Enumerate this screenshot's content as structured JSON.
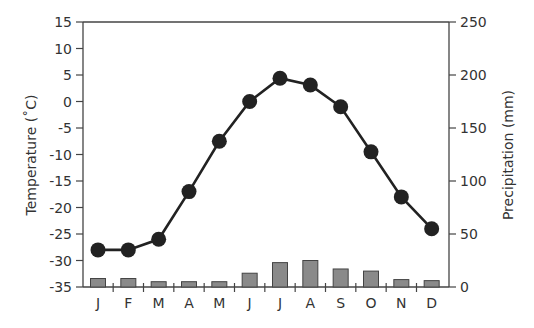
{
  "chart_data": {
    "type": "climate-chart (line + bar, dual axis)",
    "categories": [
      "J",
      "F",
      "M",
      "A",
      "M",
      "J",
      "J",
      "A",
      "S",
      "O",
      "N",
      "D"
    ],
    "series": [
      {
        "name": "Temperature",
        "type": "line",
        "axis": "left",
        "unit": "°C",
        "values": [
          -28,
          -28,
          -26,
          -17,
          -7.5,
          0,
          4.4,
          3.1,
          -1,
          -9.5,
          -18,
          -24
        ],
        "color": "#222222",
        "marker": "filled-circle"
      },
      {
        "name": "Precipitation",
        "type": "bar",
        "axis": "right",
        "unit": "mm",
        "values": [
          8,
          8,
          5,
          5,
          5,
          13,
          23,
          25,
          17,
          15,
          7,
          6
        ],
        "color": "#8a8a8a",
        "edge_color": "#444444"
      }
    ],
    "title": "",
    "xlabel": "",
    "ylabel": "Temperature (°C)",
    "y2label": "Precipitation (mm)",
    "ylim": [
      -35,
      15
    ],
    "y2lim": [
      0,
      250
    ],
    "yticks": [
      15,
      10,
      5,
      0,
      -5,
      -10,
      -15,
      -20,
      -25,
      -30,
      -35
    ],
    "y2ticks": [
      250,
      200,
      150,
      100,
      50,
      0
    ],
    "grid": false,
    "legend": null
  },
  "labels": {
    "left_axis_title": "Temperature (˚C)",
    "right_axis_title": "Precipitation (mm)"
  }
}
